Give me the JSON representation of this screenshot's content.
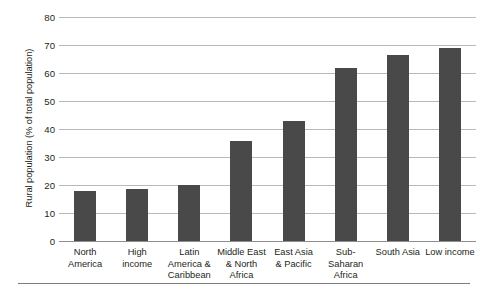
{
  "chart_data": {
    "type": "bar",
    "title": "",
    "xlabel": "",
    "ylabel": "Rural population (% of total population)",
    "ylim": [
      0,
      80
    ],
    "yticks": [
      80,
      70,
      60,
      50,
      40,
      30,
      20,
      10,
      0
    ],
    "grid": true,
    "legend": null,
    "bar_color": "#494949",
    "gridline_color": "#b9b9b9",
    "categories": [
      "North America",
      "High income",
      "Latin America & Caribbean",
      "Middle East & North Africa",
      "East Asia & Pacific",
      "Sub-Saharan Africa",
      "South Asia",
      "Low income"
    ],
    "category_lines": [
      [
        "North",
        "America"
      ],
      [
        "High income"
      ],
      [
        "Latin",
        "America &",
        "Caribbean"
      ],
      [
        "Middle East",
        "& North",
        "Africa"
      ],
      [
        "East Asia",
        "& Pacific"
      ],
      [
        "Sub-Saharan",
        "Africa"
      ],
      [
        "South Asia"
      ],
      [
        "Low income"
      ]
    ],
    "values": [
      18.0,
      18.6,
      20.0,
      35.6,
      42.9,
      61.8,
      66.6,
      69.0
    ]
  }
}
